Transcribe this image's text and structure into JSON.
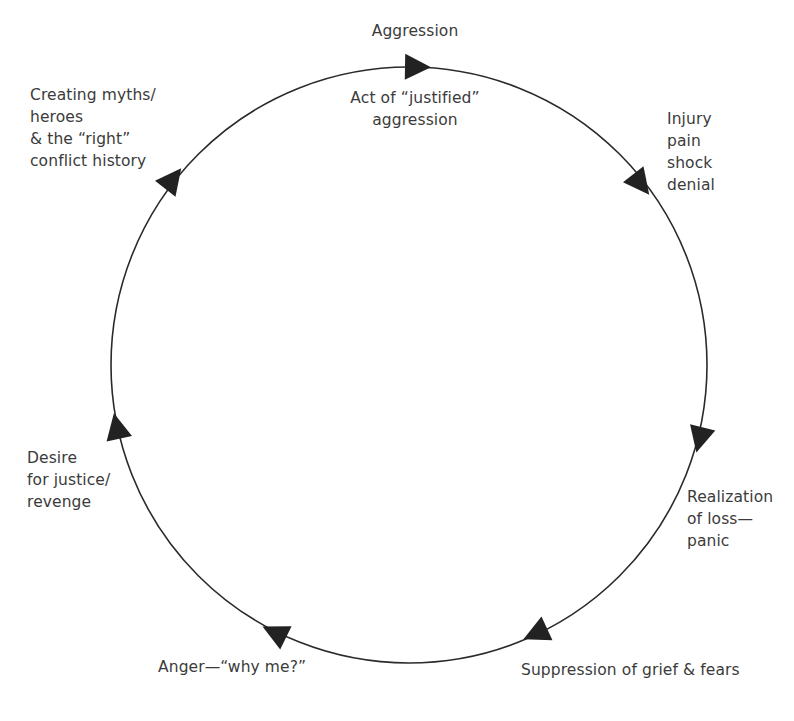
{
  "diagram": {
    "type": "cycle",
    "direction": "clockwise",
    "colors": {
      "line": "#2a2a2a",
      "arrow": "#222222",
      "text": "#3b3b3b",
      "background": "#ffffff"
    },
    "circle": {
      "cx": 409,
      "cy": 365,
      "r": 298
    },
    "stages": [
      {
        "id": "aggression",
        "lines": [
          "Aggression"
        ]
      },
      {
        "id": "act-of-justified-aggression",
        "lines": [
          "Act of “justified”",
          "aggression"
        ]
      },
      {
        "id": "injury",
        "lines": [
          "Injury",
          "pain",
          "shock",
          "denial"
        ]
      },
      {
        "id": "realization",
        "lines": [
          "Realization",
          "of loss—",
          "panic"
        ]
      },
      {
        "id": "suppression",
        "lines": [
          "Suppression of grief & fears"
        ]
      },
      {
        "id": "anger",
        "lines": [
          "Anger—“why me?”"
        ]
      },
      {
        "id": "desire",
        "lines": [
          "Desire",
          "for justice/",
          "revenge"
        ]
      },
      {
        "id": "myths",
        "lines": [
          "Creating myths/",
          "heroes",
          "& the “right”",
          "conflict history"
        ]
      }
    ],
    "arrows": [
      {
        "name": "arrow-top",
        "x": 416,
        "y": 67,
        "rotation": 1
      },
      {
        "name": "arrow-upper-right",
        "x": 640,
        "y": 183,
        "rotation": 52
      },
      {
        "name": "arrow-right",
        "x": 700,
        "y": 438,
        "rotation": 104
      },
      {
        "name": "arrow-lower-right",
        "x": 537,
        "y": 633,
        "rotation": 155
      },
      {
        "name": "arrow-lower-left",
        "x": 276,
        "y": 633,
        "rotation": 206
      },
      {
        "name": "arrow-left",
        "x": 117,
        "y": 428,
        "rotation": 258
      },
      {
        "name": "arrow-upper-left",
        "x": 172,
        "y": 180,
        "rotation": 308
      }
    ]
  }
}
